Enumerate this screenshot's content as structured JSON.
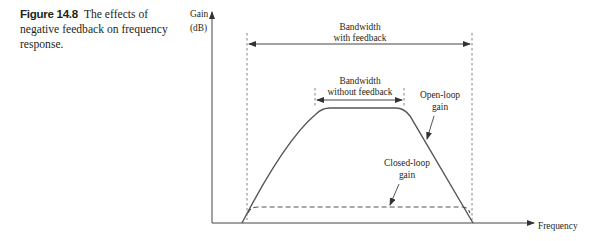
{
  "caption": {
    "figure_label": "Figure 14.8",
    "text": "The effects of negative feedback on frequency response."
  },
  "axes": {
    "y_label_line1": "Gain",
    "y_label_line2": "(dB)",
    "x_label": "Frequency"
  },
  "annotations": {
    "bw_with_line1": "Bandwidth",
    "bw_with_line2": "with feedback",
    "bw_without_line1": "Bandwidth",
    "bw_without_line2": "without feedback",
    "open_loop_line1": "Open-loop",
    "open_loop_line2": "gain",
    "closed_loop_line1": "Closed-loop",
    "closed_loop_line2": "gain"
  },
  "colors": {
    "line": "#555555",
    "text": "#231f20"
  }
}
